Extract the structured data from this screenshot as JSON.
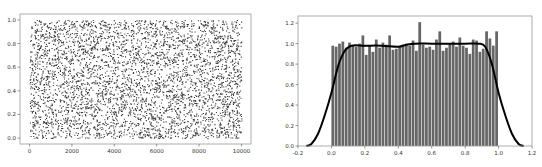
{
  "chart_data": [
    {
      "type": "scatter",
      "title": "",
      "xlabel": "",
      "ylabel": "",
      "xlim": [
        -450,
        10450
      ],
      "ylim": [
        -0.05,
        1.05
      ],
      "x_ticks": [
        "0",
        "2000",
        "4000",
        "6000",
        "8000",
        "10000"
      ],
      "y_ticks": [
        "0.0",
        "0.2",
        "0.4",
        "0.6",
        "0.8",
        "1.0"
      ],
      "grid": false,
      "series": [
        {
          "name": "uniform random samples",
          "n_points": 10000,
          "x_range": [
            0,
            10000
          ],
          "y_range": [
            0,
            1
          ],
          "color": "#1a1a1a"
        }
      ]
    },
    {
      "type": "bar",
      "subtype": "histogram_with_kde",
      "title": "",
      "xlabel": "",
      "ylabel": "",
      "xlim": [
        -0.2,
        1.2
      ],
      "ylim": [
        0,
        1.27
      ],
      "x_ticks": [
        "-0.2",
        "0.0",
        "0.2",
        "0.4",
        "0.6",
        "0.8",
        "1.0",
        "1.2"
      ],
      "y_ticks": [
        "0.0",
        "0.2",
        "0.4",
        "0.6",
        "0.8",
        "1.0",
        "1.2"
      ],
      "grid": false,
      "bin_range": [
        0.0,
        1.0
      ],
      "bins": 50,
      "values": [
        0.98,
        0.97,
        1.0,
        1.02,
        0.96,
        1.01,
        0.98,
        0.97,
        1.0,
        1.08,
        0.89,
        0.98,
        0.92,
        1.04,
        0.96,
        1.01,
        0.99,
        1.08,
        0.94,
        0.95,
        0.97,
        0.99,
        1.0,
        0.98,
        1.03,
        0.93,
        1.21,
        0.99,
        0.96,
        0.97,
        0.94,
        1.04,
        1.12,
        0.93,
        0.96,
        1.0,
        1.02,
        0.97,
        1.06,
        0.98,
        0.96,
        0.9,
        1.04,
        1.03,
        0.92,
        0.95,
        1.12,
        1.05,
        0.98,
        1.12
      ],
      "bar_color": "#555555",
      "kde": {
        "x": [
          -0.15,
          -0.12,
          -0.08,
          -0.04,
          0.0,
          0.04,
          0.08,
          0.12,
          0.2,
          0.3,
          0.4,
          0.45,
          0.5,
          0.6,
          0.7,
          0.8,
          0.88,
          0.92,
          0.96,
          1.0,
          1.04,
          1.08,
          1.12,
          1.15
        ],
        "y": [
          0.0,
          0.02,
          0.12,
          0.3,
          0.52,
          0.78,
          0.93,
          0.98,
          0.98,
          0.98,
          0.97,
          0.99,
          1.0,
          1.0,
          1.0,
          1.0,
          1.0,
          0.97,
          0.8,
          0.52,
          0.3,
          0.12,
          0.02,
          0.0
        ],
        "color": "#000000"
      }
    }
  ]
}
